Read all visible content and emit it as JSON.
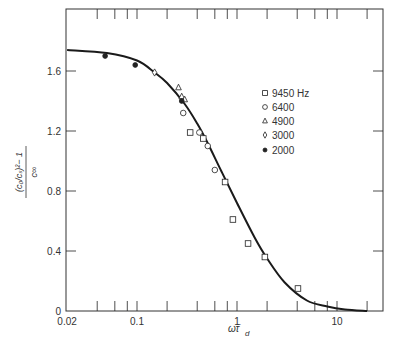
{
  "chart_data": {
    "type": "scatter",
    "title": "",
    "xlabel": "ω τ̄_d",
    "ylabel": "((c₀/cₛ)² − 1) / c_∞",
    "xscale": "log",
    "xlim": [
      0.02,
      30
    ],
    "ylim": [
      0,
      1.8
    ],
    "x_ticks": [
      0.02,
      0.1,
      1,
      10
    ],
    "x_tick_labels": [
      "0.02",
      "0.1",
      "1",
      "10"
    ],
    "y_ticks": [
      0,
      0.4,
      0.8,
      1.2,
      1.6
    ],
    "y_tick_labels": [
      "0",
      "0.4",
      "0.8",
      "1.2",
      "1.6"
    ],
    "grid": false,
    "legend_position": "center-right",
    "series": [
      {
        "name": "9450 Hz",
        "marker": "square",
        "points": [
          [
            0.34,
            1.19
          ],
          [
            0.46,
            1.15
          ],
          [
            0.76,
            0.86
          ],
          [
            0.91,
            0.61
          ],
          [
            1.29,
            0.45
          ],
          [
            1.9,
            0.36
          ],
          [
            4.07,
            0.15
          ]
        ]
      },
      {
        "name": "6400",
        "marker": "circle",
        "points": [
          [
            0.29,
            1.32
          ],
          [
            0.42,
            1.19
          ],
          [
            0.51,
            1.1
          ],
          [
            0.6,
            0.94
          ]
        ]
      },
      {
        "name": "4900",
        "marker": "triangle",
        "points": [
          [
            0.26,
            1.49
          ],
          [
            0.28,
            1.43
          ],
          [
            0.3,
            1.41
          ]
        ]
      },
      {
        "name": "3000",
        "marker": "diamond",
        "points": [
          [
            0.15,
            1.59
          ]
        ]
      },
      {
        "name": "2000",
        "marker": "filled-circle",
        "points": [
          [
            0.048,
            1.7
          ],
          [
            0.096,
            1.64
          ],
          [
            0.28,
            1.4
          ]
        ]
      }
    ],
    "fit_curve": {
      "name": "theory",
      "x": [
        0.02,
        0.05,
        0.1,
        0.15,
        0.2,
        0.3,
        0.4,
        0.5,
        0.7,
        1,
        1.5,
        2,
        3,
        5,
        8,
        12,
        20
      ],
      "y": [
        1.74,
        1.72,
        1.67,
        1.59,
        1.52,
        1.38,
        1.25,
        1.13,
        0.93,
        0.72,
        0.49,
        0.35,
        0.19,
        0.07,
        0.03,
        0.01,
        0.0
      ]
    }
  },
  "legend": {
    "items": [
      {
        "label": "9450 Hz",
        "marker": "square"
      },
      {
        "label": "6400",
        "marker": "circle"
      },
      {
        "label": "4900",
        "marker": "triangle"
      },
      {
        "label": "3000",
        "marker": "diamond"
      },
      {
        "label": "2000",
        "marker": "filled-circle"
      }
    ]
  },
  "axes": {
    "x_title_main": "ωτ̄",
    "x_title_sub": "d",
    "y_title_num": "(c₀/cₛ)²− 1",
    "y_title_den": "c∞"
  },
  "colors": {
    "ink": "#222222",
    "background": "#ffffff"
  }
}
